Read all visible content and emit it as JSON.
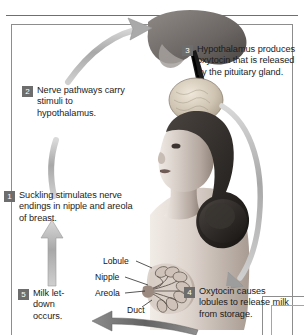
{
  "figure": {
    "steps": [
      {
        "number": "1",
        "text": "Suckling stimulates nerve endings in nipple and areola of breast."
      },
      {
        "number": "2",
        "text": "Nerve pathways carry stimuli to hypothalamus."
      },
      {
        "number": "3",
        "text": "Hypothalamus produces oxytocin that is released by the pituitary gland."
      },
      {
        "number": "4",
        "text": "Oxytocin causes lobules to release milk from storage."
      },
      {
        "number": "5",
        "text": "Milk let-down occurs."
      }
    ],
    "anatomy_labels": [
      {
        "name": "lobule",
        "text": "Lobule"
      },
      {
        "name": "nipple",
        "text": "Nipple"
      },
      {
        "name": "areola",
        "text": "Areola"
      },
      {
        "name": "duct",
        "text": "Duct"
      }
    ],
    "arrows": [
      {
        "name": "arrow-step1-to-step2",
        "direction": "up"
      },
      {
        "name": "arrow-step2-to-step3",
        "direction": "up-right"
      },
      {
        "name": "arrow-step3-to-step4",
        "direction": "down"
      },
      {
        "name": "arrow-step4-to-step5",
        "direction": "left"
      }
    ],
    "illustrations": [
      {
        "name": "brain-hypothalamus-pituitary-illustration"
      },
      {
        "name": "woman-head-torso-illustration"
      },
      {
        "name": "breast-cross-section-illustration"
      }
    ],
    "colors": {
      "badge_background": "#6d6d6d",
      "badge_text": "#ffffff",
      "body_text": "#1c1c1c",
      "arrow_light": "#b4b4b4",
      "arrow_dark": "#6f6f6f",
      "frame_border": "#8d8d8d",
      "page_background": "#ffffff"
    }
  }
}
